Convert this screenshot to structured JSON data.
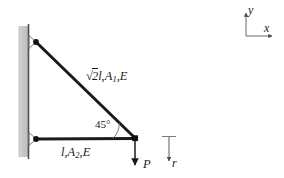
{
  "figure": {
    "type": "statics-truss-diagram",
    "colors": {
      "member": "#1a1a1a",
      "wall_fill": "#c9c9c9",
      "wall_edge": "#555555",
      "text": "#1a1a1a",
      "background": "#ffffff",
      "thin_line": "#6b6b6b"
    }
  },
  "labels": {
    "diagonal_member": {
      "radical": "√",
      "under_radical": "2",
      "length": "l",
      "area": "A",
      "area_sub": "1",
      "modulus": "E",
      "comma": ","
    },
    "horizontal_member": {
      "length": "l",
      "area": "A",
      "area_sub": "2",
      "modulus": "E",
      "comma": ","
    },
    "angle": "45°",
    "load": "P",
    "reaction": "r",
    "axis_y": "y",
    "axis_x": "x"
  },
  "geometry": {
    "wall": {
      "x": 19,
      "y": 26,
      "width": 9,
      "height": 131
    },
    "nodes": [
      {
        "name": "top-pin-node",
        "x": 36,
        "y": 42
      },
      {
        "name": "bottom-pin-node",
        "x": 36,
        "y": 139
      },
      {
        "name": "free-node",
        "x": 135,
        "y": 138
      }
    ],
    "members": [
      {
        "name": "diagonal-member",
        "from": [
          36,
          42
        ],
        "to": [
          135,
          138
        ]
      },
      {
        "name": "horizontal-member",
        "from": [
          36,
          139
        ],
        "to": [
          135,
          138
        ]
      }
    ],
    "load_arrow": {
      "from": [
        135,
        140
      ],
      "to": [
        135,
        167
      ]
    },
    "reaction_arrow": {
      "from": [
        169,
        137
      ],
      "to": [
        169,
        163
      ]
    },
    "axes_origin": [
      246,
      36
    ]
  }
}
